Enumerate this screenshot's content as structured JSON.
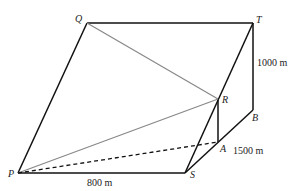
{
  "diagram": {
    "type": "3d-geometry-figure",
    "points": {
      "P": {
        "label": "P",
        "x": 18,
        "y": 173
      },
      "Q": {
        "label": "Q",
        "x": 87,
        "y": 23
      },
      "T": {
        "label": "T",
        "x": 253,
        "y": 23
      },
      "B": {
        "label": "B",
        "x": 253,
        "y": 110
      },
      "S": {
        "label": "S",
        "x": 185,
        "y": 173
      },
      "R": {
        "label": "R",
        "x": 218,
        "y": 99
      },
      "A": {
        "label": "A",
        "x": 218,
        "y": 142
      }
    },
    "measurements": {
      "TB": "1000 m",
      "SB": "1500 m",
      "PS": "800 m"
    },
    "colors": {
      "edge": "#111111",
      "sightline": "#888888"
    }
  }
}
